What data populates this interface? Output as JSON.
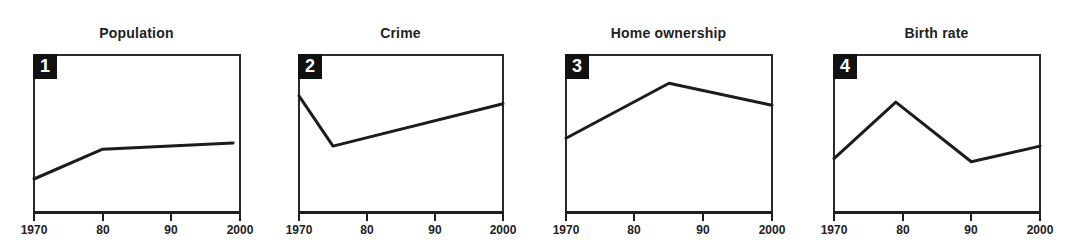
{
  "chart_data": [
    {
      "type": "line",
      "panel_number": "1",
      "title": "Population",
      "xlabel": "",
      "ylabel": "",
      "x": [
        1970,
        1980,
        1999
      ],
      "values": [
        21,
        40,
        44
      ],
      "xlim": [
        1970,
        2000
      ],
      "ylim": [
        0,
        100
      ],
      "xticks": [
        "1970",
        "80",
        "90",
        "2000"
      ],
      "grid": false
    },
    {
      "type": "line",
      "panel_number": "2",
      "title": "Crime",
      "xlabel": "",
      "ylabel": "",
      "x": [
        1970,
        1975,
        2000
      ],
      "values": [
        74,
        42,
        69
      ],
      "xlim": [
        1970,
        2000
      ],
      "ylim": [
        0,
        100
      ],
      "xticks": [
        "1970",
        "80",
        "90",
        "2000"
      ],
      "grid": false
    },
    {
      "type": "line",
      "panel_number": "3",
      "title": "Home ownership",
      "xlabel": "",
      "ylabel": "",
      "x": [
        1970,
        1985,
        2000
      ],
      "values": [
        47,
        82,
        68
      ],
      "xlim": [
        1970,
        2000
      ],
      "ylim": [
        0,
        100
      ],
      "xticks": [
        "1970",
        "80",
        "90",
        "2000"
      ],
      "grid": false
    },
    {
      "type": "line",
      "panel_number": "4",
      "title": "Birth rate",
      "xlabel": "",
      "ylabel": "",
      "x": [
        1970,
        1979,
        1990,
        2000
      ],
      "values": [
        34,
        70,
        32,
        42
      ],
      "xlim": [
        1970,
        2000
      ],
      "ylim": [
        0,
        100
      ],
      "xticks": [
        "1970",
        "80",
        "90",
        "2000"
      ],
      "grid": false
    }
  ],
  "panels": [
    {
      "number": "1",
      "title": "Population",
      "ticks": [
        "1970",
        "80",
        "90",
        "2000"
      ]
    },
    {
      "number": "2",
      "title": "Crime",
      "ticks": [
        "1970",
        "80",
        "90",
        "2000"
      ]
    },
    {
      "number": "3",
      "title": "Home ownership",
      "ticks": [
        "1970",
        "80",
        "90",
        "2000"
      ]
    },
    {
      "number": "4",
      "title": "Birth rate",
      "ticks": [
        "1970",
        "80",
        "90",
        "2000"
      ]
    }
  ],
  "colors": {
    "line": "#1c1c1c",
    "frame": "#2a2a2a",
    "badge_bg": "#111111",
    "badge_text": "#ffffff"
  }
}
